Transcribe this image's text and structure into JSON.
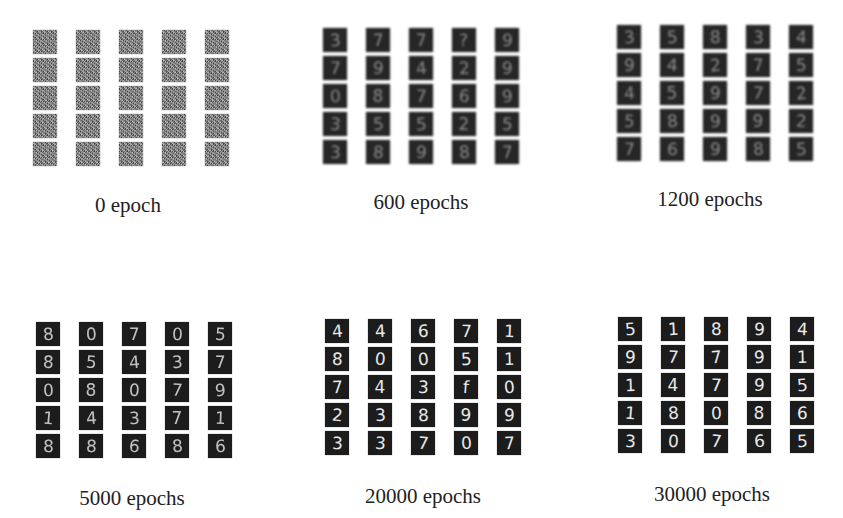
{
  "figure": {
    "panels": [
      {
        "caption": "0 epoch",
        "style": "noise",
        "grid_origin": [
          33,
          30
        ],
        "caption_pos": [
          128,
          193
        ],
        "digits": [
          [
            "",
            "",
            "",
            "",
            ""
          ],
          [
            "",
            "",
            "",
            "",
            ""
          ],
          [
            "",
            "",
            "",
            "",
            ""
          ],
          [
            "",
            "",
            "",
            "",
            ""
          ],
          [
            "",
            "",
            "",
            "",
            ""
          ]
        ]
      },
      {
        "caption": "600 epochs",
        "style": "blur",
        "grid_origin": [
          323,
          28
        ],
        "caption_pos": [
          421,
          190
        ],
        "digits": [
          [
            "3",
            "7",
            "7",
            "?",
            "9"
          ],
          [
            "7",
            "9",
            "4",
            "2",
            "9"
          ],
          [
            "0",
            "8",
            "7",
            "6",
            "9"
          ],
          [
            "3",
            "5",
            "5",
            "2",
            "5"
          ],
          [
            "3",
            "8",
            "9",
            "8",
            "7"
          ]
        ]
      },
      {
        "caption": "1200 epochs",
        "style": "blur",
        "grid_origin": [
          617,
          25
        ],
        "caption_pos": [
          710,
          187
        ],
        "digits": [
          [
            "3",
            "5",
            "8",
            "3",
            "4"
          ],
          [
            "9",
            "4",
            "2",
            "7",
            "5"
          ],
          [
            "4",
            "5",
            "9",
            "7",
            "2"
          ],
          [
            "5",
            "8",
            "9",
            "9",
            "2"
          ],
          [
            "7",
            "6",
            "9",
            "8",
            "5"
          ]
        ]
      },
      {
        "caption": "5000 epochs",
        "style": "soft",
        "grid_origin": [
          36,
          322
        ],
        "caption_pos": [
          132,
          486
        ],
        "digits": [
          [
            "8",
            "0",
            "7",
            "0",
            "5"
          ],
          [
            "8",
            "5",
            "4",
            "3",
            "7"
          ],
          [
            "0",
            "8",
            "0",
            "7",
            "9"
          ],
          [
            "1",
            "4",
            "3",
            "7",
            "1"
          ],
          [
            "8",
            "8",
            "6",
            "8",
            "6"
          ]
        ]
      },
      {
        "caption": "20000 epochs",
        "style": "sharp",
        "grid_origin": [
          325,
          319
        ],
        "caption_pos": [
          423,
          484
        ],
        "digits": [
          [
            "4",
            "4",
            "6",
            "7",
            "1"
          ],
          [
            "8",
            "0",
            "0",
            "5",
            "1"
          ],
          [
            "7",
            "4",
            "3",
            "f",
            "0"
          ],
          [
            "2",
            "3",
            "8",
            "9",
            "9"
          ],
          [
            "3",
            "3",
            "7",
            "0",
            "7"
          ]
        ]
      },
      {
        "caption": "30000 epochs",
        "style": "sharp",
        "grid_origin": [
          618,
          317
        ],
        "caption_pos": [
          712,
          482
        ],
        "digits": [
          [
            "5",
            "1",
            "8",
            "9",
            "4"
          ],
          [
            "9",
            "7",
            "7",
            "9",
            "1"
          ],
          [
            "1",
            "4",
            "7",
            "9",
            "5"
          ],
          [
            "1",
            "8",
            "0",
            "8",
            "6"
          ],
          [
            "3",
            "0",
            "7",
            "6",
            "5"
          ]
        ]
      }
    ],
    "grid": {
      "rows": 5,
      "cols": 5,
      "col_step": 43,
      "row_step": 28
    },
    "colors": {
      "background": "#ffffff",
      "tile": "#1c1c1c",
      "stroke": "#e8e8e8",
      "caption": "#222222"
    }
  }
}
